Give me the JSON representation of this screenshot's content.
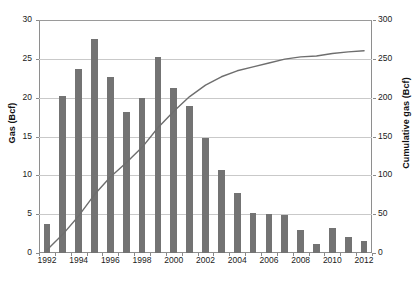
{
  "chart_data": {
    "type": "bar",
    "title": "",
    "subtitle": "",
    "xlabel": "",
    "ylabel": "Gas (Bcf)",
    "y2label": "Cumulative gas (Bcf)",
    "categories": [
      "1992",
      "1993",
      "1994",
      "1995",
      "1996",
      "1997",
      "1998",
      "1999",
      "2000",
      "2001",
      "2002",
      "2003",
      "2004",
      "2005",
      "2006",
      "2007",
      "2008",
      "2009",
      "2010",
      "2011",
      "2012"
    ],
    "x_tick_labels": [
      "1992",
      "1994",
      "1996",
      "1998",
      "2000",
      "2002",
      "2004",
      "2006",
      "2008",
      "2010",
      "2012"
    ],
    "ylim": [
      0,
      30
    ],
    "y_ticks": [
      0,
      5,
      10,
      15,
      20,
      25,
      30
    ],
    "y2lim": [
      0,
      300
    ],
    "y2_ticks": [
      0,
      50,
      100,
      150,
      200,
      250,
      300
    ],
    "grid": true,
    "legend": "none",
    "series": [
      {
        "name": "Gas (Bcf)",
        "type": "bar",
        "axis": "left",
        "color": "#737373",
        "values": [
          3.8,
          20.2,
          23.7,
          27.5,
          22.7,
          18.2,
          19.9,
          25.2,
          21.3,
          18.9,
          14.8,
          10.7,
          7.7,
          5.1,
          5.0,
          4.9,
          2.9,
          1.1,
          3.2,
          2.1,
          1.6
        ]
      },
      {
        "name": "Cumulative gas (Bcf)",
        "type": "line",
        "axis": "right",
        "color": "#6e6e6e",
        "values": [
          3.8,
          24.0,
          47.7,
          75.2,
          97.9,
          116.1,
          136.0,
          161.2,
          182.5,
          201.4,
          216.2,
          226.9,
          234.6,
          239.7,
          244.7,
          249.6,
          252.5,
          253.6,
          256.8,
          258.9,
          260.5
        ]
      }
    ],
    "annotations": []
  },
  "axes": {
    "left_title": "Gas (Bcf)",
    "right_title": "Cumulative gas (Bcf)"
  },
  "caption": {
    "text": ""
  }
}
